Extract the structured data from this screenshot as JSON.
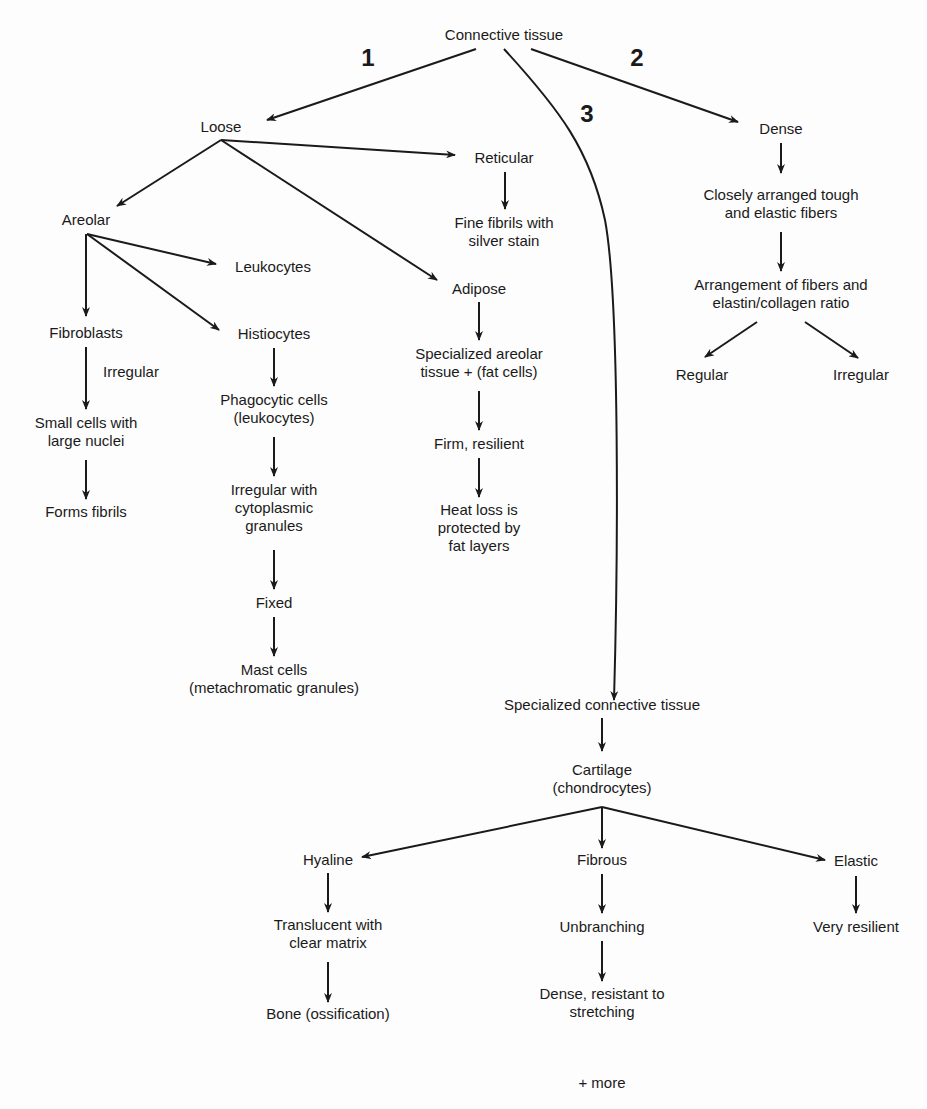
{
  "diagram": {
    "root": "Connective tissue",
    "branch_numbers": [
      "1",
      "2",
      "3"
    ],
    "loose": {
      "title": "Loose",
      "areolar": {
        "title": "Areolar",
        "leukocytes": "Leukocytes",
        "fibroblasts": {
          "title": "Fibroblasts",
          "edge_label": "Irregular",
          "step1": [
            "Small cells with",
            "large nuclei"
          ],
          "step2": "Forms fibrils"
        },
        "histiocytes": {
          "title": "Histiocytes",
          "step1": [
            "Phagocytic cells",
            "(leukocytes)"
          ],
          "step2": [
            "Irregular with",
            "cytoplasmic",
            "granules"
          ],
          "step3": "Fixed",
          "step4": [
            "Mast cells",
            "(metachromatic granules)"
          ]
        }
      },
      "reticular": {
        "title": "Reticular",
        "step1": [
          "Fine fibrils with",
          "silver stain"
        ]
      },
      "adipose": {
        "title": "Adipose",
        "step1": [
          "Specialized areolar",
          "tissue + (fat cells)"
        ],
        "step2": "Firm, resilient",
        "step3": [
          "Heat loss is",
          "protected by",
          "fat layers"
        ]
      }
    },
    "dense": {
      "title": "Dense",
      "step1": [
        "Closely arranged tough",
        "and elastic fibers"
      ],
      "step2": [
        "Arrangement of fibers and",
        "elastin/collagen ratio"
      ],
      "regular": "Regular",
      "irregular": "Irregular"
    },
    "specialized": {
      "title": "Specialized connective tissue",
      "cartilage": [
        "Cartilage",
        "(chondrocytes)"
      ],
      "hyaline": {
        "title": "Hyaline",
        "step1": [
          "Translucent with",
          "clear matrix"
        ],
        "step2": "Bone (ossification)"
      },
      "fibrous": {
        "title": "Fibrous",
        "step1": "Unbranching",
        "step2": [
          "Dense, resistant to",
          "stretching"
        ]
      },
      "elastic": {
        "title": "Elastic",
        "step1": "Very resilient"
      },
      "more": "+ more"
    }
  }
}
